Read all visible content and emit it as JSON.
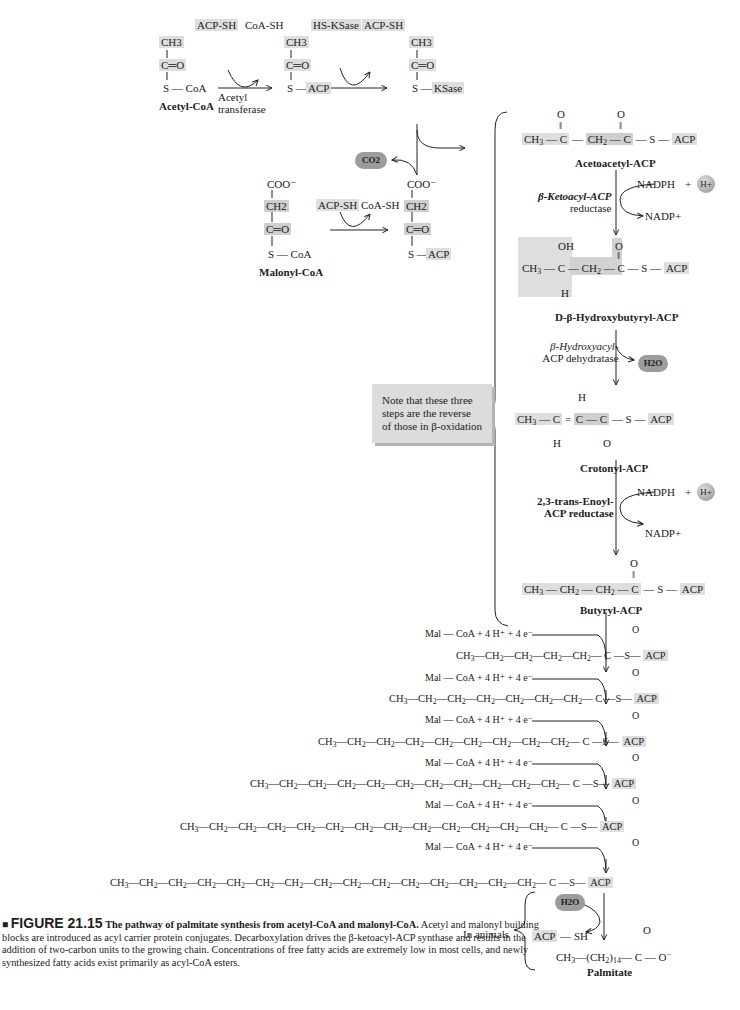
{
  "figure": {
    "number_label": "FIGURE 21.15",
    "title": "The pathway of palmitate synthesis from acetyl-CoA and malonyl-CoA.",
    "caption": "Acetyl and malonyl building blocks are introduced as acyl carrier protein conjugates. Decarboxylation drives the β-ketoacyl-ACP synthase and results in the addition of two-carbon units to the growing chain. Concentrations of free fatty acids are extremely low in most cells, and newly synthesized fatty acids exist primarily as acyl-CoA esters."
  },
  "priming": {
    "acetyl_coa": {
      "ch3": "CH3",
      "co": "C═O",
      "s": "S — CoA",
      "name": "Acetyl-CoA"
    },
    "step1": {
      "in": "ACP-SH",
      "out": "CoA-SH",
      "enzyme_line1": "Acetyl",
      "enzyme_line2": "transferase"
    },
    "acetyl_acp": {
      "ch3": "CH3",
      "co": "C═O",
      "s": "S —",
      "acp": "ACP"
    },
    "step2": {
      "in": "HS-KSase",
      "out": "ACP-SH"
    },
    "acetyl_ksase": {
      "ch3": "CH3",
      "co": "C═O",
      "s": "S —",
      "ksase": "KSase"
    },
    "co2": "CO2",
    "malonyl_coa": {
      "coo": "COO⁻",
      "ch2": "CH2",
      "co": "C═O",
      "s": "S — CoA",
      "name": "Malonyl-CoA"
    },
    "step3": {
      "in": "ACP-SH",
      "out": "CoA-SH"
    },
    "malonyl_acp": {
      "coo": "COO⁻",
      "ch2": "CH2",
      "co": "C═O",
      "s": "S —",
      "acp": "ACP"
    }
  },
  "cycle": {
    "acetoacetyl": {
      "formula": "CH3 — C — CH2 — C — S — ACP",
      "name": "Acetoacetyl-ACP"
    },
    "reductase1": {
      "enzyme_line1": "β-Ketoacyl-ACP",
      "enzyme_line2": "reductase",
      "in": "NADPH",
      "plus": "+",
      "proton": "H+",
      "out": "NADP+"
    },
    "hydroxybutyryl": {
      "name": "D-β-Hydroxybutyryl-ACP",
      "oh": "OH",
      "h": "H"
    },
    "dehydratase": {
      "enzyme_line1": "β-Hydroxyacyl-",
      "enzyme_line2": "ACP dehydratase",
      "out": "H2O"
    },
    "crotonyl": {
      "name": "Crotonyl-ACP",
      "h_top": "H",
      "h_bottom": "H",
      "o": "O"
    },
    "reductase2": {
      "enzyme_line1": "2,3-trans-Enoyl-",
      "enzyme_line2": "ACP reductase",
      "in": "NADPH",
      "plus": "+",
      "proton": "H+",
      "out": "NADP+"
    },
    "butyryl": {
      "name": "Butyryl-ACP"
    },
    "note": "Note that these three steps are the reverse of those in β-oxidation"
  },
  "elongation": {
    "reagent": "Mal — CoA + 4 H⁺ + 4 e⁻",
    "rows": [
      {
        "carbons": 6,
        "ch2_count": 4
      },
      {
        "carbons": 8,
        "ch2_count": 6
      },
      {
        "carbons": 10,
        "ch2_count": 8
      },
      {
        "carbons": 12,
        "ch2_count": 10
      },
      {
        "carbons": 14,
        "ch2_count": 12
      },
      {
        "carbons": 16,
        "ch2_count": 14
      }
    ],
    "acp": "ACP",
    "o": "O"
  },
  "release": {
    "label": "In animals",
    "water": "H2O",
    "acp_sh": "ACP — SH",
    "palmitate_formula": "CH3—(CH2)14—C—O⁻",
    "palmitate_name": "Palmitate"
  }
}
